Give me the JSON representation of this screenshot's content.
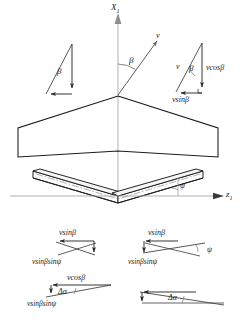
{
  "figure": {
    "colors": {
      "outline": "#1a1a1a",
      "axis": "#a8a8a8",
      "centerline": "#bdbdbd",
      "vector": "#2b2b2b",
      "chord_line": "#8a8a8a",
      "background": "#ffffff"
    }
  },
  "axes": {
    "vertical": {
      "label": "X",
      "subscript": "1",
      "name": "x1-axis"
    },
    "horizontal": {
      "label": "z",
      "subscript": "1",
      "name": "z1-axis"
    }
  },
  "velocity_vector": {
    "label": "v",
    "angle_label": "β"
  },
  "triangle_left_top": {
    "angle_label": "β"
  },
  "triangle_right_top": {
    "hypotenuse_label": "v",
    "angle_label": "β",
    "vertical_label": "vcosβ",
    "horizontal_label": "vsinβ"
  },
  "wing_planform": {
    "name": "swept-wing-top-view"
  },
  "wing_front_view": {
    "name": "wing-front-view-dihedral",
    "dihedral_angle_label": "ψ"
  },
  "vector_group_left": {
    "top_label": "vsinβ",
    "bottom_label": "vsinβsinψ"
  },
  "vector_group_right": {
    "top_label": "vsinβ",
    "angle_label": "ψ",
    "bottom_label": "vsinβsinψ"
  },
  "triangle_left_bottom": {
    "top_label": "vcosβ",
    "angle_label": "Δα",
    "bottom_label": "vsinβsinψ"
  },
  "triangle_right_bottom": {
    "angle_label": "Δα"
  }
}
